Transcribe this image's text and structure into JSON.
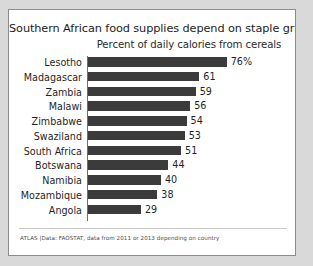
{
  "chart_data": {
    "type": "bar",
    "orientation": "horizontal",
    "title": "Southern African food supplies depend on staple grains",
    "subtitle": "Percent of daily calories from cereals",
    "xlabel": "",
    "ylabel": "",
    "xlim": [
      0,
      80
    ],
    "grid": false,
    "legend": "none",
    "bar_color": "#3b3b3b",
    "categories": [
      "Lesotho",
      "Madagascar",
      "Zambia",
      "Malawi",
      "Zimbabwe",
      "Swaziland",
      "South Africa",
      "Botswana",
      "Namibia",
      "Mozambique",
      "Angola"
    ],
    "values": [
      76,
      61,
      59,
      56,
      54,
      53,
      51,
      44,
      40,
      38,
      29
    ],
    "value_labels": [
      "76%",
      "61",
      "59",
      "56",
      "54",
      "53",
      "51",
      "44",
      "40",
      "38",
      "29"
    ],
    "source": "ATLAS |Data: FAOSTAT, data from 2011 or 2013 depending on country"
  }
}
